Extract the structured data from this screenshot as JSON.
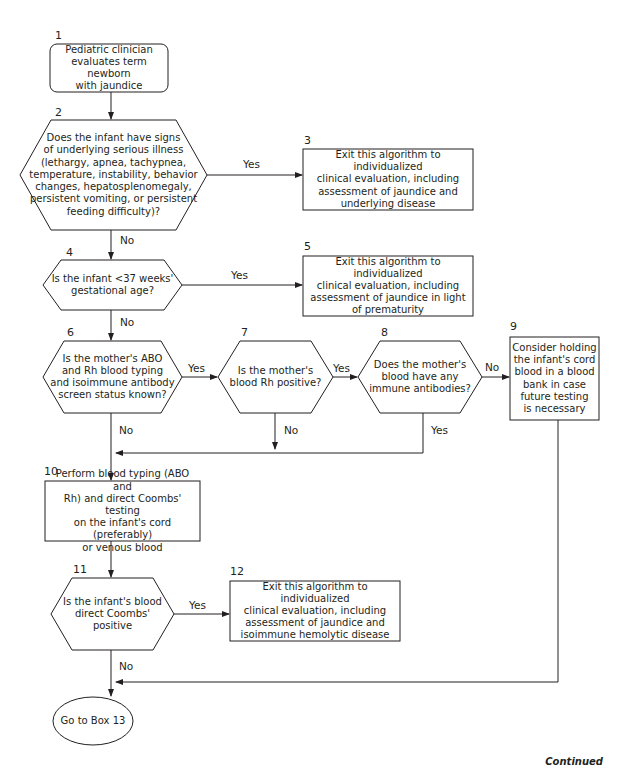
{
  "nodes": [
    {
      "id": "1",
      "shape": "rounded-rect",
      "text": "Pediatric clinician\nevaluates term newborn\nwith jaundice"
    },
    {
      "id": "2",
      "shape": "hexagon",
      "text": "Does the infant have signs\nof underlying serious illness\n(lethargy, apnea, tachypnea,\ntemperature, instability, behavior\nchanges, hepatosplenomegaly,\npersistent vomiting, or persistent\nfeeding difficulty)?"
    },
    {
      "id": "3",
      "shape": "rect",
      "text": "Exit this algorithm to individualized\nclinical evaluation, including\nassessment of jaundice and\nunderlying disease"
    },
    {
      "id": "4",
      "shape": "hexagon",
      "text": "Is the infant <37 weeks'\ngestational age?"
    },
    {
      "id": "5",
      "shape": "rect",
      "text": "Exit this algorithm to individualized\nclinical evaluation, including\nassessment of jaundice in light\nof prematurity"
    },
    {
      "id": "6",
      "shape": "hexagon",
      "text": "Is the mother's ABO\nand Rh blood typing\nand isoimmune antibody\nscreen status known?"
    },
    {
      "id": "7",
      "shape": "hexagon",
      "text": "Is the mother's\nblood Rh positive?"
    },
    {
      "id": "8",
      "shape": "hexagon",
      "text": "Does the mother's\nblood have any\nimmune antibodies?"
    },
    {
      "id": "9",
      "shape": "rect",
      "text": "Consider holding\nthe infant's cord\nblood in a blood\nbank in case\nfuture testing\nis necessary"
    },
    {
      "id": "10",
      "shape": "rect",
      "text": "Perform blood typing (ABO and\nRh) and direct Coombs' testing\non the infant's cord (preferably)\nor venous blood"
    },
    {
      "id": "11",
      "shape": "hexagon",
      "text": "Is the infant's blood\ndirect Coombs'\npositive"
    },
    {
      "id": "12",
      "shape": "rect",
      "text": "Exit this algorithm to individualized\nclinical evaluation, including\nassessment of jaundice and\nisoimmune hemolytic disease"
    },
    {
      "id": "13",
      "shape": "oval",
      "text": "Go to Box 13"
    }
  ],
  "edges": [
    {
      "from": "1",
      "to": "2",
      "label": ""
    },
    {
      "from": "2",
      "to": "3",
      "label": "Yes"
    },
    {
      "from": "2",
      "to": "4",
      "label": "No"
    },
    {
      "from": "4",
      "to": "5",
      "label": "Yes"
    },
    {
      "from": "4",
      "to": "6",
      "label": "No"
    },
    {
      "from": "6",
      "to": "7",
      "label": "Yes"
    },
    {
      "from": "6",
      "to": "10",
      "label": "No"
    },
    {
      "from": "7",
      "to": "8",
      "label": "Yes"
    },
    {
      "from": "7",
      "to": "10",
      "label": "No"
    },
    {
      "from": "8",
      "to": "9",
      "label": "No"
    },
    {
      "from": "8",
      "to": "10",
      "label": "Yes"
    },
    {
      "from": "10",
      "to": "11",
      "label": ""
    },
    {
      "from": "11",
      "to": "12",
      "label": "Yes"
    },
    {
      "from": "11",
      "to": "13",
      "label": "No"
    },
    {
      "from": "9",
      "to": "13",
      "label": ""
    }
  ],
  "labels": {
    "yes": "Yes",
    "no": "No"
  },
  "footer": "Continued",
  "colors": {
    "line": "#231f20",
    "background": "#ffffff"
  }
}
